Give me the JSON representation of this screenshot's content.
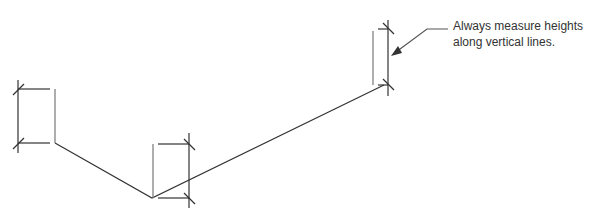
{
  "annotation": {
    "line1": "Always measure heights",
    "line2": "along vertical lines."
  },
  "colors": {
    "line": "#333333",
    "extension": "#777777",
    "text": "#333333"
  },
  "diagram": {
    "profile_points": [
      [
        55,
        143
      ],
      [
        152,
        198
      ],
      [
        384,
        85
      ]
    ],
    "height_dimensions": [
      {
        "name": "left",
        "ext_x": 55,
        "dim_x": 18,
        "top": 89,
        "bottom": 143
      },
      {
        "name": "middle",
        "ext_x": 153,
        "dim_x": 189,
        "top": 144,
        "bottom": 198
      },
      {
        "name": "right",
        "ext_x": 373,
        "dim_x": 388,
        "top": 29,
        "bottom": 85
      }
    ]
  }
}
